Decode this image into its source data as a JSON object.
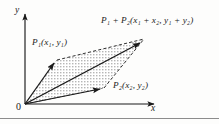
{
  "figure": {
    "type": "vector-addition-parallelogram-diagram",
    "background_color": "#fdfdfc",
    "stroke_color": "#1a1a1a",
    "fill_pattern": "stipple-dots",
    "labels": {
      "sum_point": "P₁ + P₂(x₁ + x₂, y₁ + y₂)",
      "point_p1": "P₁(x₁, y₁)",
      "point_p2": "P₂(x₂, y₂)",
      "y_axis": "y",
      "x_axis": "x",
      "origin": "0"
    },
    "geometry": {
      "origin": [
        25,
        104
      ],
      "p1": [
        57,
        60
      ],
      "p2": [
        104,
        88
      ],
      "sum": [
        144,
        39
      ],
      "y_axis_top": [
        25,
        10
      ],
      "x_axis_right": [
        158,
        104
      ]
    },
    "bottom_rule": {
      "y": 118,
      "color": "#8c8c8c"
    }
  }
}
